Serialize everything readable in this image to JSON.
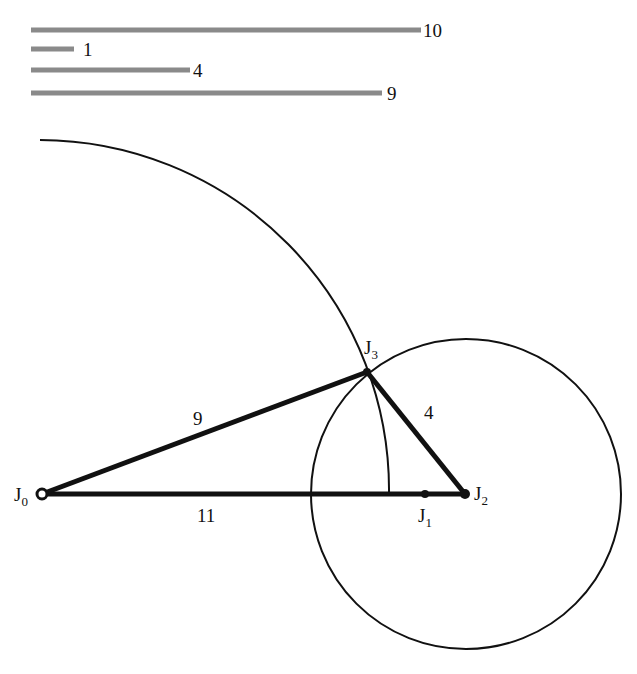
{
  "legend_bars": [
    {
      "label": "10",
      "x1": 31,
      "x2": 421,
      "y": 30
    },
    {
      "label": "1",
      "x1": 31,
      "x2": 74,
      "y": 49
    },
    {
      "label": "4",
      "x1": 31,
      "x2": 190,
      "y": 70
    },
    {
      "label": "9",
      "x1": 31,
      "x2": 382,
      "y": 93
    }
  ],
  "joints": {
    "J0": {
      "name": "J",
      "sub": "0",
      "x": 42,
      "y": 494
    },
    "J1": {
      "name": "J",
      "sub": "1",
      "x": 425,
      "y": 494
    },
    "J2": {
      "name": "J",
      "sub": "2",
      "x": 465,
      "y": 494
    },
    "J3": {
      "name": "J",
      "sub": "3",
      "x": 367,
      "y": 372
    }
  },
  "links": [
    {
      "from": "J0",
      "to": "J3",
      "label": "9"
    },
    {
      "from": "J3",
      "to": "J2",
      "label": "4"
    },
    {
      "from": "J0",
      "to": "J2",
      "label": "11"
    }
  ],
  "colors": {
    "ink": "#111111",
    "bar": "#8a8a8a"
  }
}
